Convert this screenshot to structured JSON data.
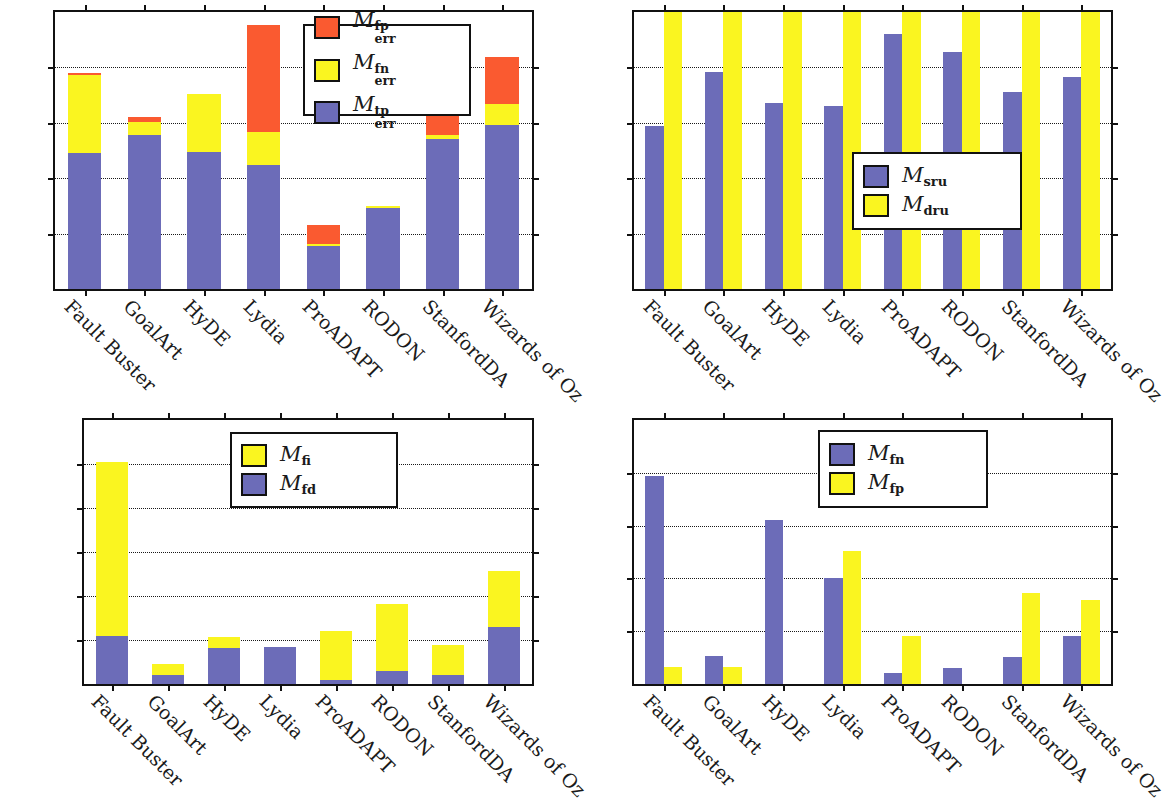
{
  "figure": {
    "categories": [
      "Fault Buster",
      "GoalArt",
      "HyDE",
      "Lydia",
      "ProADAPT",
      "RODON",
      "StanfordDA",
      "Wizards of Oz"
    ]
  },
  "panels": {
    "top_left": {
      "name": "error-cost-chart",
      "y_ticks": [
        "0",
        "50",
        "100",
        "150",
        "200",
        "250"
      ],
      "legend": [
        {
          "label_base": "M",
          "label_sub": "err",
          "label_sup": "fp",
          "color": "#FA5A30"
        },
        {
          "label_base": "M",
          "label_sub": "err",
          "label_sup": "fn",
          "color": "#FAF520"
        },
        {
          "label_base": "M",
          "label_sub": "err",
          "label_sup": "tp",
          "color": "#6C6CB8"
        }
      ]
    },
    "top_right": {
      "name": "utility-chart",
      "y_ticks": [
        "0",
        "0.2",
        "0.4",
        "0.6",
        "0.8",
        "1"
      ],
      "legend": [
        {
          "label_base": "M",
          "label_sub": "sru",
          "label_sup": "",
          "color": "#6C6CB8"
        },
        {
          "label_base": "M",
          "label_sub": "dru",
          "label_sup": "",
          "color": "#FAF520"
        }
      ]
    },
    "bottom_left": {
      "name": "fault-count-chart",
      "y_ticks": [
        "0",
        "20 000",
        "40 000",
        "60 000",
        "80 000",
        "100 000",
        "120 000"
      ],
      "legend": [
        {
          "label_base": "M",
          "label_sub": "fi",
          "label_sup": "",
          "color": "#FAF520"
        },
        {
          "label_base": "M",
          "label_sub": "fd",
          "label_sup": "",
          "color": "#6C6CB8"
        }
      ]
    },
    "bottom_right": {
      "name": "false-rate-chart",
      "y_ticks": [
        "0",
        "0.1",
        "0.2",
        "0.3",
        "0.4",
        "0.5"
      ],
      "legend": [
        {
          "label_base": "M",
          "label_sub": "fn",
          "label_sup": "",
          "color": "#6C6CB8"
        },
        {
          "label_base": "M",
          "label_sub": "fp",
          "label_sup": "",
          "color": "#FAF520"
        }
      ]
    }
  },
  "chart_data": [
    {
      "id": "top_left",
      "type": "bar",
      "stacked": true,
      "title": "",
      "xlabel": "",
      "ylabel": "",
      "ylim": [
        0,
        250
      ],
      "yticks": [
        0,
        50,
        100,
        150,
        200,
        250
      ],
      "grid": true,
      "legend_position": "top-right-inside",
      "categories": [
        "Fault Buster",
        "GoalArt",
        "HyDE",
        "Lydia",
        "ProADAPT",
        "RODON",
        "StanfordDA",
        "Wizards of Oz"
      ],
      "series": [
        {
          "name": "M_err^tp",
          "color": "#6C6CB8",
          "values": [
            123,
            139,
            124,
            112,
            39,
            73,
            135,
            148
          ]
        },
        {
          "name": "M_err^fn",
          "color": "#FAF520",
          "values": [
            70,
            12,
            52,
            30,
            2,
            2,
            4,
            19
          ]
        },
        {
          "name": "M_err^fp",
          "color": "#FA5A30",
          "values": [
            2,
            4,
            0,
            96,
            17,
            0,
            39,
            42
          ]
        }
      ],
      "totals": [
        195,
        155,
        176,
        238,
        58,
        75,
        178,
        209
      ]
    },
    {
      "id": "top_right",
      "type": "bar",
      "stacked": false,
      "title": "",
      "xlabel": "",
      "ylabel": "",
      "ylim": [
        0,
        1
      ],
      "yticks": [
        0,
        0.2,
        0.4,
        0.6,
        0.8,
        1
      ],
      "grid": true,
      "legend_position": "center-inside",
      "categories": [
        "Fault Buster",
        "GoalArt",
        "HyDE",
        "Lydia",
        "ProADAPT",
        "RODON",
        "StanfordDA",
        "Wizards of Oz"
      ],
      "series": [
        {
          "name": "M_sru",
          "color": "#6C6CB8",
          "values": [
            0.59,
            0.785,
            0.67,
            0.66,
            0.92,
            0.855,
            0.71,
            0.765
          ]
        },
        {
          "name": "M_dru",
          "color": "#FAF520",
          "values": [
            1.0,
            1.0,
            1.0,
            1.0,
            1.0,
            1.0,
            1.0,
            1.0
          ]
        }
      ]
    },
    {
      "id": "bottom_left",
      "type": "bar",
      "stacked": true,
      "title": "",
      "xlabel": "",
      "ylabel": "",
      "ylim": [
        0,
        120000
      ],
      "yticks": [
        0,
        20000,
        40000,
        60000,
        80000,
        100000,
        120000
      ],
      "grid": true,
      "legend_position": "top-center-inside",
      "categories": [
        "Fault Buster",
        "GoalArt",
        "HyDE",
        "Lydia",
        "ProADAPT",
        "RODON",
        "StanfordDA",
        "Wizards of Oz"
      ],
      "series": [
        {
          "name": "M_fd",
          "color": "#6C6CB8",
          "values": [
            21800,
            4000,
            16200,
            16700,
            1900,
            6100,
            4100,
            25800
          ]
        },
        {
          "name": "M_fi",
          "color": "#FAF520",
          "values": [
            79200,
            5000,
            5300,
            0,
            22100,
            30100,
            13600,
            25400
          ]
        }
      ],
      "totals": [
        101000,
        9000,
        21500,
        16700,
        24000,
        36200,
        17700,
        51200
      ]
    },
    {
      "id": "bottom_right",
      "type": "bar",
      "stacked": false,
      "title": "",
      "xlabel": "",
      "ylabel": "",
      "ylim": [
        0,
        0.5
      ],
      "yticks": [
        0,
        0.1,
        0.2,
        0.3,
        0.4,
        0.5
      ],
      "grid": true,
      "legend_position": "top-center-inside",
      "categories": [
        "Fault Buster",
        "GoalArt",
        "HyDE",
        "Lydia",
        "ProADAPT",
        "RODON",
        "StanfordDA",
        "Wizards of Oz"
      ],
      "series": [
        {
          "name": "M_fn",
          "color": "#6C6CB8",
          "values": [
            0.393,
            0.053,
            0.311,
            0.2,
            0.021,
            0.031,
            0.051,
            0.09
          ]
        },
        {
          "name": "M_fp",
          "color": "#FAF520",
          "values": [
            0.033,
            0.033,
            0.0,
            0.252,
            0.091,
            0.0,
            0.172,
            0.16
          ]
        }
      ]
    }
  ]
}
